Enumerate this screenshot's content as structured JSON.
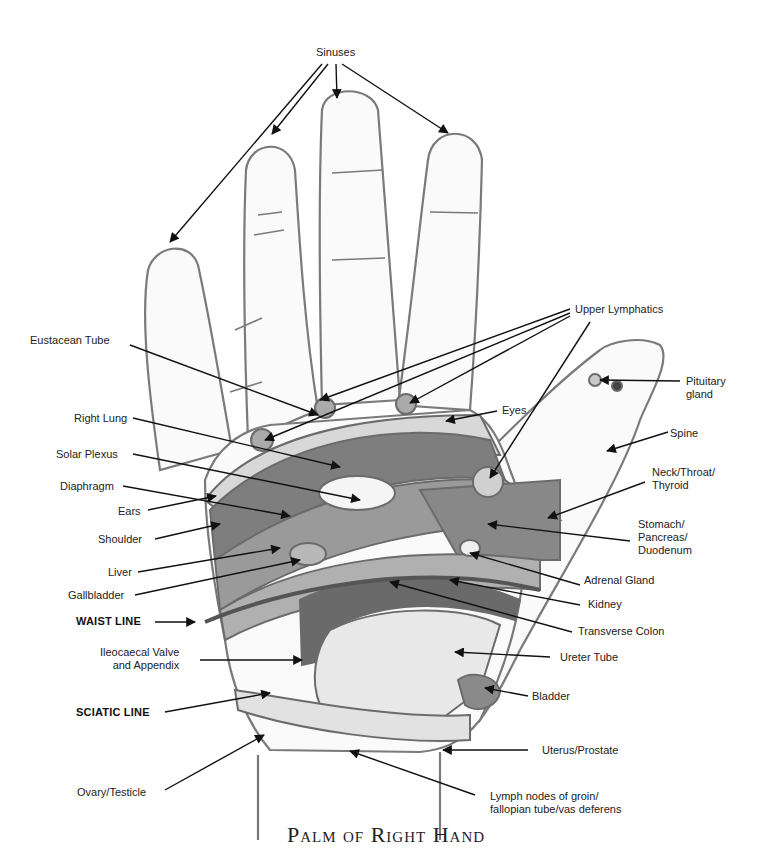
{
  "title": "Palm of Right Hand",
  "colors": {
    "outline": "#7a7a7a",
    "dark_zone": "#6e6e6e",
    "mid_zone": "#8e8e8e",
    "light_zone": "#b4b4b4",
    "pale_zone": "#e6e6e6",
    "arrow": "#111111"
  },
  "labels": {
    "sinuses": "Sinuses",
    "upper_lymphatics": "Upper Lymphatics",
    "eustacean_tube": "Eustacean Tube",
    "pituitary_gland": "Pituitary\ngland",
    "eyes": "Eyes",
    "spine": "Spine",
    "right_lung": "Right Lung",
    "solar_plexus": "Solar Plexus",
    "neck_throat_thyroid": "Neck/Throat/\nThyroid",
    "diaphragm": "Diaphragm",
    "ears": "Ears",
    "stomach_pancreas_duodenum": "Stomach/\nPancreas/\nDuodenum",
    "shoulder": "Shoulder",
    "liver": "Liver",
    "adrenal_gland": "Adrenal Gland",
    "gallbladder": "Gallbladder",
    "kidney": "Kidney",
    "waist_line": "WAIST LINE",
    "transverse_colon": "Transverse Colon",
    "ileocaecal_valve": "Ileocaecal Valve\nand Appendix",
    "ureter_tube": "Ureter Tube",
    "bladder": "Bladder",
    "sciatic_line": "SCIATIC LINE",
    "uterus_prostate": "Uterus/Prostate",
    "ovary_testicle": "Ovary/Testicle",
    "lymph_nodes": "Lymph nodes of groin/\nfallopian tube/vas deferens"
  }
}
